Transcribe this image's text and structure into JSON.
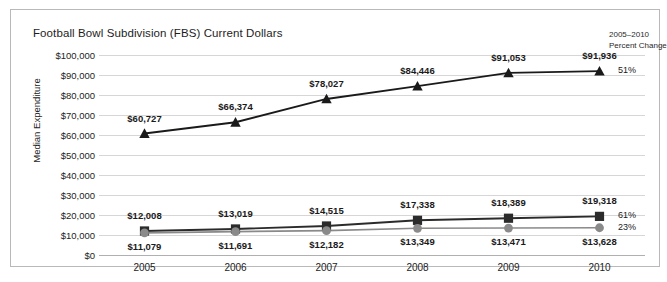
{
  "chart_title": "Football Bowl Subdivision (FBS) Current Dollars",
  "annotation": {
    "header_line1": "2005–2010",
    "header_line2": "Percent Change"
  },
  "chart_data": {
    "type": "line",
    "title": "Football Bowl Subdivision (FBS) Current Dollars",
    "xlabel": "",
    "ylabel": "Median Expenditure",
    "categories": [
      "2005",
      "2006",
      "2007",
      "2008",
      "2009",
      "2010"
    ],
    "ylim": [
      0,
      100000
    ],
    "ytick_labels": [
      "$100,000",
      "$90,000",
      "$80,000",
      "$70,000",
      "$60,000",
      "$50,000",
      "$40,000",
      "$30,000",
      "$20,000",
      "$10,000",
      "$0"
    ],
    "ytick_values": [
      100000,
      90000,
      80000,
      70000,
      60000,
      50000,
      40000,
      30000,
      20000,
      10000,
      0
    ],
    "grid": true,
    "legend": "none",
    "series": [
      {
        "name": "series-triangle",
        "marker": "triangle",
        "color": "#1a1a1a",
        "values": [
          60727,
          66374,
          78027,
          84446,
          91053,
          91936
        ],
        "labels": [
          "$60,727",
          "$66,374",
          "$78,027",
          "$84,446",
          "$91,053",
          "$91,936"
        ],
        "label_position": "above",
        "percent_change": "51%"
      },
      {
        "name": "series-square",
        "marker": "square",
        "color": "#2b2b2b",
        "values": [
          12008,
          13019,
          14515,
          17338,
          18389,
          19318
        ],
        "labels": [
          "$12,008",
          "$13,019",
          "$14,515",
          "$17,338",
          "$18,389",
          "$19,318"
        ],
        "label_position": "above",
        "percent_change": "61%"
      },
      {
        "name": "series-circle",
        "marker": "circle",
        "color": "#8a8a8a",
        "values": [
          11079,
          11691,
          12182,
          13349,
          13471,
          13628
        ],
        "labels": [
          "$11,079",
          "$11,691",
          "$12,182",
          "$13,349",
          "$13,471",
          "$13,628"
        ],
        "label_position": "below",
        "percent_change": "23%"
      }
    ]
  },
  "colors": {
    "grid": "#d6d6d6",
    "border": "#b9b9b9",
    "text": "#1a1a1a",
    "triangle_series": "#1a1a1a",
    "square_series": "#2b2b2b",
    "circle_series": "#8a8a8a"
  }
}
